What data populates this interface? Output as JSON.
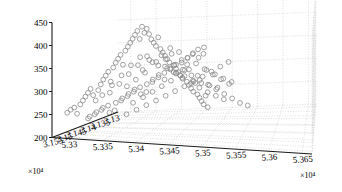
{
  "chart_data": {
    "type": "scatter",
    "projection": "3d",
    "title": "",
    "xlabel": "",
    "ylabel": "",
    "zlabel": "",
    "grid": true,
    "legend": null,
    "axes": {
      "x": {
        "name": "x-axis-bottom-right",
        "multiplier": "×10⁴",
        "multiplier_value": 10000,
        "ticks": [
          5.33,
          5.335,
          5.34,
          5.345,
          5.35,
          5.355,
          5.36,
          5.365
        ],
        "tick_labels": [
          "5.33",
          "5.335",
          "5.34",
          "5.345",
          "5.35",
          "5.355",
          "5.36",
          "5.365"
        ],
        "range": [
          5.3275,
          5.3665
        ]
      },
      "y": {
        "name": "y-axis-bottom-left",
        "multiplier": "×10⁴",
        "multiplier_value": 10000,
        "ticks": [
          3.155,
          3.15,
          3.145,
          3.14,
          3.135,
          3.13
        ],
        "tick_labels": [
          "3.155",
          "3.15",
          "3.145",
          "3.14",
          "3.135",
          "3.13"
        ],
        "range": [
          3.1565,
          3.1285
        ]
      },
      "z": {
        "name": "z-axis-vertical",
        "multiplier": "",
        "ticks": [
          200,
          250,
          300,
          350,
          400,
          450
        ],
        "tick_labels": [
          "200",
          "250",
          "300",
          "350",
          "400",
          "450"
        ],
        "range": [
          200,
          450
        ]
      }
    },
    "marker": {
      "shape": "open-circle",
      "radius_px": 2.4,
      "stroke": "#8a8a8a",
      "fill": "none"
    },
    "colors": {
      "grid": "#b9b9b9",
      "axis": "#1a1a1a",
      "marker": "#8a8a8a",
      "background": "#ffffff"
    },
    "points": [
      [
        5.3292,
        3.1548,
        252
      ],
      [
        5.3296,
        3.1544,
        258
      ],
      [
        5.33,
        3.154,
        262
      ],
      [
        5.3303,
        3.1536,
        248
      ],
      [
        5.3307,
        3.1533,
        268
      ],
      [
        5.331,
        3.153,
        276
      ],
      [
        5.3313,
        3.1527,
        284
      ],
      [
        5.3316,
        3.1524,
        292
      ],
      [
        5.3319,
        3.1521,
        300
      ],
      [
        5.3322,
        3.1518,
        286
      ],
      [
        5.3325,
        3.1515,
        274
      ],
      [
        5.3328,
        3.1512,
        296
      ],
      [
        5.3331,
        3.1509,
        308
      ],
      [
        5.3334,
        3.1506,
        318
      ],
      [
        5.3337,
        3.1503,
        326
      ],
      [
        5.334,
        3.15,
        334
      ],
      [
        5.3343,
        3.1497,
        312
      ],
      [
        5.3346,
        3.1494,
        342
      ],
      [
        5.3349,
        3.1491,
        352
      ],
      [
        5.3352,
        3.1488,
        360
      ],
      [
        5.3355,
        3.1485,
        368
      ],
      [
        5.3358,
        3.1482,
        346
      ],
      [
        5.3361,
        3.1479,
        376
      ],
      [
        5.3364,
        3.1476,
        384
      ],
      [
        5.3367,
        3.1473,
        392
      ],
      [
        5.337,
        3.147,
        400
      ],
      [
        5.3373,
        3.1467,
        408
      ],
      [
        5.3376,
        3.1464,
        416
      ],
      [
        5.3379,
        3.1461,
        398
      ],
      [
        5.3382,
        3.1458,
        424
      ],
      [
        5.3385,
        3.1455,
        410
      ],
      [
        5.3388,
        3.1452,
        418
      ],
      [
        5.3391,
        3.1449,
        406
      ],
      [
        5.3394,
        3.1446,
        394
      ],
      [
        5.3397,
        3.1443,
        386
      ],
      [
        5.34,
        3.144,
        378
      ],
      [
        5.3403,
        3.1437,
        396
      ],
      [
        5.3406,
        3.1434,
        370
      ],
      [
        5.3409,
        3.1431,
        362
      ],
      [
        5.3412,
        3.1428,
        354
      ],
      [
        5.3415,
        3.1425,
        346
      ],
      [
        5.3418,
        3.1422,
        338
      ],
      [
        5.3421,
        3.1419,
        356
      ],
      [
        5.3424,
        3.1416,
        330
      ],
      [
        5.3427,
        3.1413,
        322
      ],
      [
        5.343,
        3.141,
        314
      ],
      [
        5.3433,
        3.1407,
        306
      ],
      [
        5.3436,
        3.1404,
        298
      ],
      [
        5.3439,
        3.1401,
        316
      ],
      [
        5.3442,
        3.1398,
        290
      ],
      [
        5.3445,
        3.1395,
        282
      ],
      [
        5.3448,
        3.1392,
        274
      ],
      [
        5.3451,
        3.1389,
        266
      ],
      [
        5.3454,
        3.1386,
        284
      ],
      [
        5.3457,
        3.1383,
        258
      ],
      [
        5.346,
        3.138,
        250
      ],
      [
        5.3463,
        3.1377,
        242
      ],
      [
        5.3466,
        3.1374,
        234
      ],
      [
        5.3469,
        3.1371,
        252
      ],
      [
        5.3472,
        3.1368,
        226
      ],
      [
        5.331,
        3.1506,
        232
      ],
      [
        5.3318,
        3.1498,
        240
      ],
      [
        5.3326,
        3.149,
        248
      ],
      [
        5.3334,
        3.1482,
        256
      ],
      [
        5.3342,
        3.1474,
        244
      ],
      [
        5.335,
        3.1466,
        264
      ],
      [
        5.3358,
        3.1458,
        272
      ],
      [
        5.3366,
        3.145,
        280
      ],
      [
        5.3374,
        3.1442,
        288
      ],
      [
        5.3382,
        3.1434,
        276
      ],
      [
        5.339,
        3.1426,
        296
      ],
      [
        5.3398,
        3.1418,
        304
      ],
      [
        5.3406,
        3.141,
        312
      ],
      [
        5.3414,
        3.1402,
        320
      ],
      [
        5.3422,
        3.1394,
        308
      ],
      [
        5.343,
        3.1386,
        328
      ],
      [
        5.3438,
        3.1378,
        336
      ],
      [
        5.3446,
        3.137,
        344
      ],
      [
        5.3454,
        3.1362,
        332
      ],
      [
        5.3462,
        3.1354,
        352
      ],
      [
        5.33,
        3.147,
        228
      ],
      [
        5.3308,
        3.1462,
        236
      ],
      [
        5.3316,
        3.1454,
        244
      ],
      [
        5.3324,
        3.1446,
        232
      ],
      [
        5.3332,
        3.1438,
        252
      ],
      [
        5.334,
        3.143,
        260
      ],
      [
        5.3348,
        3.1422,
        268
      ],
      [
        5.3356,
        3.1414,
        276
      ],
      [
        5.3364,
        3.1406,
        264
      ],
      [
        5.3372,
        3.1398,
        284
      ],
      [
        5.338,
        3.139,
        292
      ],
      [
        5.3388,
        3.1382,
        300
      ],
      [
        5.3396,
        3.1374,
        288
      ],
      [
        5.3404,
        3.1366,
        308
      ],
      [
        5.3412,
        3.1358,
        316
      ],
      [
        5.342,
        3.135,
        324
      ],
      [
        5.3428,
        3.1342,
        312
      ],
      [
        5.3436,
        3.1334,
        332
      ],
      [
        5.3444,
        3.1326,
        340
      ],
      [
        5.3452,
        3.1318,
        328
      ],
      [
        5.334,
        3.153,
        290
      ],
      [
        5.3352,
        3.152,
        310
      ],
      [
        5.3364,
        3.151,
        330
      ],
      [
        5.3376,
        3.15,
        350
      ],
      [
        5.3388,
        3.149,
        366
      ],
      [
        5.34,
        3.148,
        358
      ],
      [
        5.3412,
        3.147,
        344
      ],
      [
        5.3424,
        3.146,
        336
      ],
      [
        5.3436,
        3.145,
        322
      ],
      [
        5.3448,
        3.144,
        314
      ],
      [
        5.346,
        3.143,
        302
      ],
      [
        5.3472,
        3.142,
        294
      ],
      [
        5.3484,
        3.141,
        286
      ],
      [
        5.3496,
        3.14,
        278
      ],
      [
        5.3356,
        3.1545,
        300
      ],
      [
        5.3368,
        3.1536,
        318
      ],
      [
        5.338,
        3.1527,
        338
      ],
      [
        5.3392,
        3.1518,
        356
      ],
      [
        5.3404,
        3.1509,
        374
      ],
      [
        5.3416,
        3.15,
        360
      ],
      [
        5.3428,
        3.1491,
        348
      ],
      [
        5.344,
        3.1482,
        334
      ],
      [
        5.3452,
        3.1473,
        320
      ],
      [
        5.3464,
        3.1464,
        306
      ],
      [
        5.3476,
        3.1455,
        294
      ],
      [
        5.3488,
        3.1446,
        282
      ],
      [
        5.35,
        3.1437,
        272
      ],
      [
        5.3512,
        3.1428,
        262
      ],
      [
        5.333,
        3.138,
        214
      ],
      [
        5.3345,
        3.1372,
        222
      ],
      [
        5.336,
        3.1364,
        230
      ],
      [
        5.3375,
        3.1356,
        238
      ],
      [
        5.339,
        3.1348,
        246
      ],
      [
        5.3405,
        3.134,
        254
      ],
      [
        5.342,
        3.1332,
        262
      ],
      [
        5.3435,
        3.1324,
        270
      ],
      [
        5.345,
        3.1316,
        278
      ],
      [
        5.3465,
        3.1308,
        286
      ],
      [
        5.348,
        3.13,
        294
      ],
      [
        5.3495,
        3.1295,
        302
      ],
      [
        5.3405,
        3.154,
        352
      ],
      [
        5.3418,
        3.1532,
        368
      ],
      [
        5.343,
        3.1524,
        382
      ],
      [
        5.3442,
        3.1516,
        396
      ],
      [
        5.3454,
        3.1508,
        386
      ],
      [
        5.3466,
        3.15,
        372
      ],
      [
        5.3478,
        3.1492,
        358
      ],
      [
        5.349,
        3.1484,
        344
      ],
      [
        5.3502,
        3.1476,
        330
      ],
      [
        5.3514,
        3.1468,
        318
      ],
      [
        5.3526,
        3.146,
        306
      ],
      [
        5.3384,
        3.1552,
        318
      ],
      [
        5.3396,
        3.1546,
        332
      ],
      [
        5.3408,
        3.1538,
        346
      ],
      [
        5.3432,
        3.1504,
        368
      ],
      [
        5.3444,
        3.1496,
        354
      ],
      [
        5.3456,
        3.1488,
        342
      ],
      [
        5.3468,
        3.148,
        328
      ],
      [
        5.348,
        3.1472,
        316
      ],
      [
        5.3492,
        3.1464,
        304
      ],
      [
        5.3504,
        3.1456,
        292
      ],
      [
        5.3516,
        3.1448,
        280
      ],
      [
        5.3528,
        3.144,
        268
      ],
      [
        5.354,
        3.1432,
        256
      ],
      [
        5.3552,
        3.1424,
        248
      ],
      [
        5.3352,
        3.141,
        246
      ],
      [
        5.3366,
        3.14,
        256
      ],
      [
        5.338,
        3.1392,
        266
      ],
      [
        5.3394,
        3.1384,
        276
      ],
      [
        5.3408,
        3.1376,
        286
      ],
      [
        5.3422,
        3.1368,
        296
      ],
      [
        5.3436,
        3.136,
        306
      ],
      [
        5.345,
        3.1352,
        290
      ],
      [
        5.3464,
        3.1344,
        300
      ],
      [
        5.3478,
        3.1336,
        288
      ],
      [
        5.3492,
        3.1328,
        276
      ],
      [
        5.3506,
        3.132,
        266
      ]
    ]
  }
}
